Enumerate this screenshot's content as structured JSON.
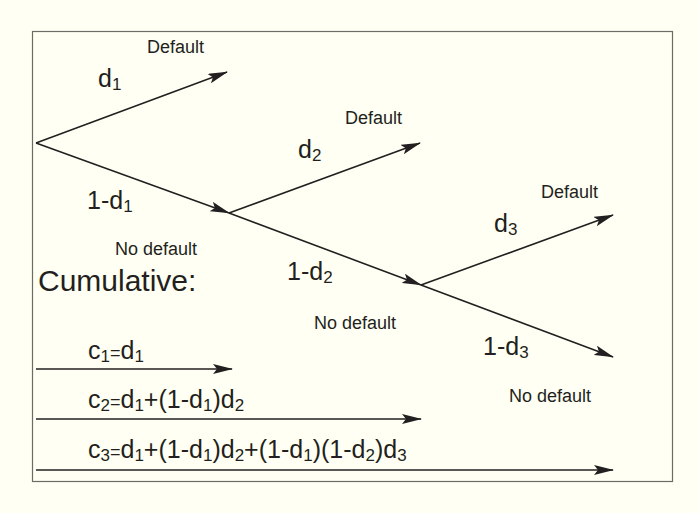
{
  "diagram": {
    "type": "probability tree",
    "frame": {
      "x": 32,
      "y": 31,
      "width": 640,
      "height": 450,
      "stroke": "#6e6a66",
      "background": "#fffff3"
    },
    "colors": {
      "ink": "#231f20",
      "background": "#fffff3"
    },
    "nodes": [
      {
        "id": "n0",
        "x": 36,
        "y": 143
      },
      {
        "id": "n1",
        "x": 229,
        "y": 213
      },
      {
        "id": "n2",
        "x": 421,
        "y": 285
      }
    ],
    "branches": [
      {
        "from": "n0",
        "to": [
          227,
          72
        ],
        "prob_base": "d",
        "prob_sub": "1",
        "prob_prefix": "",
        "outcome": "Default"
      },
      {
        "from": "n0",
        "to": [
          229,
          213
        ],
        "prob_base": "d",
        "prob_sub": "1",
        "prob_prefix": "1-",
        "outcome": "No default"
      },
      {
        "from": "n1",
        "to": [
          420,
          143
        ],
        "prob_base": "d",
        "prob_sub": "2",
        "prob_prefix": "",
        "outcome": "Default"
      },
      {
        "from": "n1",
        "to": [
          421,
          285
        ],
        "prob_base": "d",
        "prob_sub": "2",
        "prob_prefix": "1-",
        "outcome": "No default"
      },
      {
        "from": "n2",
        "to": [
          613,
          215
        ],
        "prob_base": "d",
        "prob_sub": "3",
        "prob_prefix": "",
        "outcome": "Default"
      },
      {
        "from": "n2",
        "to": [
          613,
          357
        ],
        "prob_base": "d",
        "prob_sub": "3",
        "prob_prefix": "1-",
        "outcome": "No default"
      }
    ],
    "labels": {
      "outcome_default": "Default",
      "outcome_no_default": "No default",
      "d": "d",
      "one_minus": "1-",
      "sub1": "1",
      "sub2": "2",
      "sub3": "3"
    },
    "cumulative": {
      "heading": "Cumulative:",
      "rows": [
        {
          "name": "c1",
          "text": "c1=d1",
          "arrow_end_x": 232,
          "arrow_y": 369
        },
        {
          "name": "c2",
          "text": "c2=d1+(1-d1)d2",
          "arrow_end_x": 421,
          "arrow_y": 419
        },
        {
          "name": "c3",
          "text": "c3=d1+(1-d1)d2+(1-d1)(1-d2)d3",
          "arrow_end_x": 613,
          "arrow_y": 470
        }
      ],
      "symbols": {
        "c": "c",
        "eq": "=",
        "plus": "+",
        "open": "(",
        "close": ")"
      }
    }
  }
}
